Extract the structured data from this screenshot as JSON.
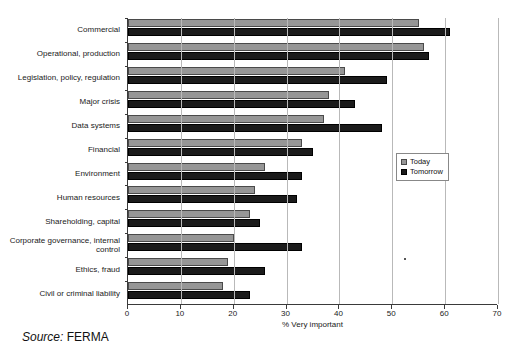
{
  "title_strip": "",
  "source": {
    "prefix": "Source:",
    "name": "FERMA"
  },
  "legend": {
    "position": "middle-right",
    "items": [
      {
        "label": "Today",
        "color": "#969696"
      },
      {
        "label": "Tomorrow",
        "color": "#1b1b1b"
      }
    ]
  },
  "axis": {
    "x_title": "% Very important",
    "ticks": [
      "0",
      "10",
      "20",
      "30",
      "40",
      "50",
      "60",
      "70"
    ]
  },
  "chart_data": {
    "type": "bar",
    "orientation": "horizontal",
    "title": "",
    "xlabel": "% Very important",
    "ylabel": "",
    "xlim": [
      0,
      70
    ],
    "xticks": [
      0,
      10,
      20,
      30,
      40,
      50,
      60,
      70
    ],
    "grid": true,
    "legend_position": "middle-right",
    "categories": [
      "Commercial",
      "Operational, production",
      "Legislation, policy, regulation",
      "Major crisis",
      "Data systems",
      "Financial",
      "Environment",
      "Human resources",
      "Shareholding, capital",
      "Corporate governance, internal control",
      "Ethics, fraud",
      "Civil or criminal liability"
    ],
    "series": [
      {
        "name": "Today",
        "color": "#969696",
        "values": [
          55,
          56,
          41,
          38,
          37,
          33,
          26,
          24,
          23,
          20,
          19,
          18
        ]
      },
      {
        "name": "Tomorrow",
        "color": "#1b1b1b",
        "values": [
          61,
          57,
          49,
          43,
          48,
          35,
          33,
          32,
          25,
          33,
          26,
          23
        ]
      }
    ]
  }
}
